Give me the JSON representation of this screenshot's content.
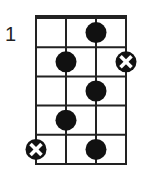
{
  "diagram": {
    "type": "chord-diagram",
    "starting_fret_label": "1",
    "strings": 4,
    "frets": 5,
    "grid": {
      "left": 36,
      "top": 18,
      "string_spacing": 30,
      "fret_spacing": 29.2
    },
    "colors": {
      "line": "#222222",
      "dot": "#111111",
      "x_mark": "#ffffff",
      "background": "#ffffff"
    },
    "markers": [
      {
        "string": 3,
        "fret": 1,
        "type": "dot"
      },
      {
        "string": 2,
        "fret": 2,
        "type": "dot"
      },
      {
        "string": 4,
        "fret": 2,
        "type": "x-circle"
      },
      {
        "string": 3,
        "fret": 3,
        "type": "dot"
      },
      {
        "string": 2,
        "fret": 4,
        "type": "dot"
      },
      {
        "string": 1,
        "fret": 5,
        "type": "x-circle"
      },
      {
        "string": 3,
        "fret": 5,
        "type": "dot"
      }
    ]
  }
}
